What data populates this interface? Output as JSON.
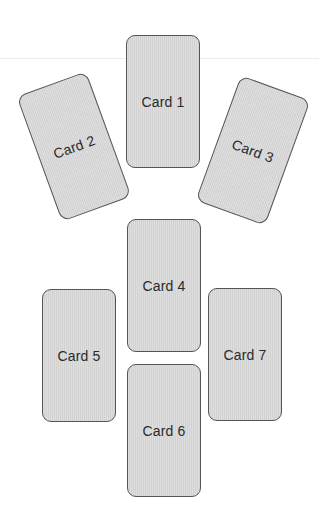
{
  "diagram": {
    "type": "card-spread-layout",
    "cards": [
      {
        "id": "card-1",
        "label": "Card 1",
        "rotation_deg": 0
      },
      {
        "id": "card-2",
        "label": "Card 2",
        "rotation_deg": -20
      },
      {
        "id": "card-3",
        "label": "Card 3",
        "rotation_deg": 20
      },
      {
        "id": "card-4",
        "label": "Card 4",
        "rotation_deg": 0
      },
      {
        "id": "card-5",
        "label": "Card 5",
        "rotation_deg": 0
      },
      {
        "id": "card-6",
        "label": "Card 6",
        "rotation_deg": 0
      },
      {
        "id": "card-7",
        "label": "Card 7",
        "rotation_deg": 0
      }
    ],
    "colors": {
      "card_fill": "#d9d9d9",
      "card_border": "#555555",
      "label": "#2a2a2a",
      "background": "#ffffff"
    }
  }
}
